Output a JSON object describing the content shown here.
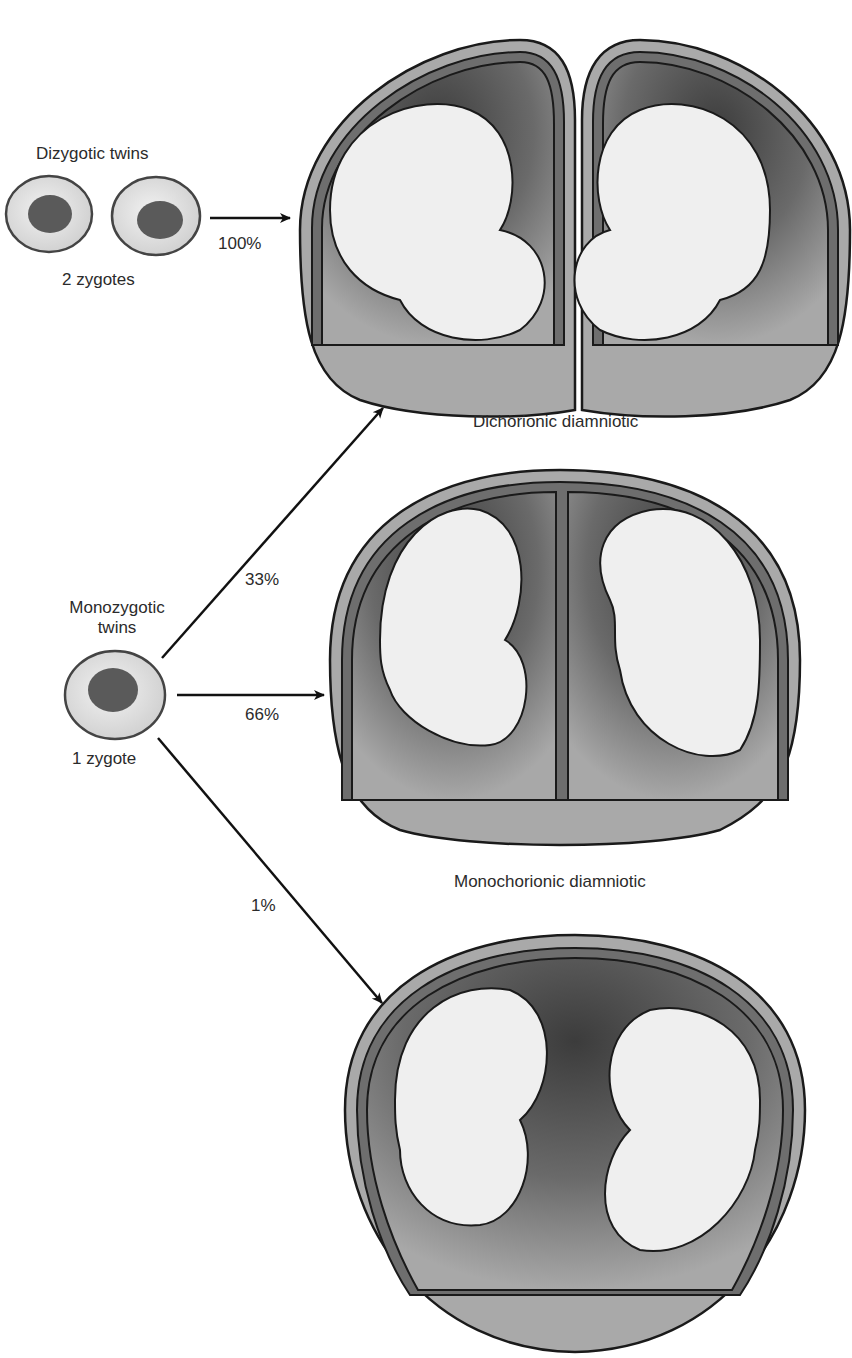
{
  "diagram": {
    "type": "twin-placentation",
    "colors": {
      "outer_wall": "#a9a9a9",
      "membrane_band": "#6e6e6e",
      "amniotic_cavity_dark": "#3f3f3f",
      "amniotic_cavity_light": "#a0a0a0",
      "fetus": "#efefef",
      "zygote_cytoplasm": "#dcdcdc",
      "zygote_nucleus": "#5a5a5a",
      "outline": "#1a1a1a"
    },
    "dizygotic": {
      "title": "Dizygotic twins",
      "zygote_label": "2 zygotes",
      "arrow_percent": "100%"
    },
    "monozygotic": {
      "title_line1": "Monozygotic",
      "title_line2": "twins",
      "zygote_label": "1 zygote",
      "arrows": [
        {
          "percent": "33%",
          "target": "Dichorionic diamniotic"
        },
        {
          "percent": "66%",
          "target": "Monochorionic diamniotic"
        },
        {
          "percent": "1%",
          "target": ""
        }
      ]
    },
    "outcomes": [
      {
        "label": "Dichorionic diamniotic"
      },
      {
        "label": "Monochorionic diamniotic"
      },
      {
        "label": ""
      }
    ]
  }
}
